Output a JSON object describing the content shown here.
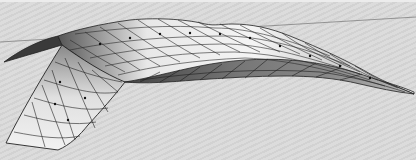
{
  "image": {
    "subject": "3D twisted surface mesh with grid lines",
    "background_color": "#d8d8d8",
    "mesh_line_color": "#2a2a2a",
    "horizon_line_color": "#777777"
  }
}
